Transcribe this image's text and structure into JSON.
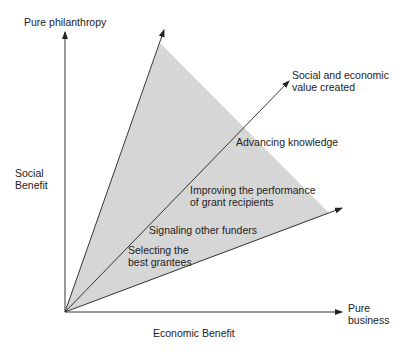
{
  "diagram": {
    "axes": {
      "y_top_label": "Pure philanthropy",
      "y_side_label": "Social\nBenefit",
      "x_end_label": "Pure\nbusiness",
      "x_bottom_label": "Economic Benefit"
    },
    "vector_label": "Social and economic\nvalue created",
    "region_labels": [
      "Advancing knowledge",
      "Improving the performance\nof grant recipients",
      "Signaling other funders",
      "Selecting the\nbest grantees"
    ],
    "colors": {
      "shaded_region": "#d6d6d6",
      "lines": "#333333",
      "background": "#ffffff"
    }
  }
}
